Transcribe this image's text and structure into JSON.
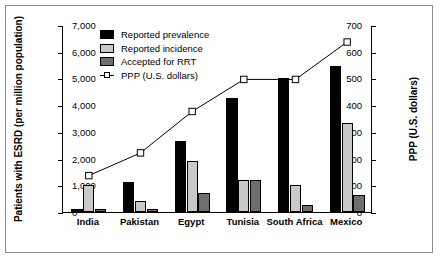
{
  "chart_data": {
    "type": "bar",
    "title": "",
    "subtitle": "",
    "categories": [
      "India",
      "Pakistan",
      "Egypt",
      "Tunisia",
      "South Africa",
      "Mexico"
    ],
    "xlabel": "",
    "ylabel": "Patients with ESRD (per million population)",
    "ylim": [
      0,
      700
    ],
    "yticks": [
      "0",
      "100",
      "200",
      "300",
      "400",
      "500",
      "600",
      "700"
    ],
    "ytick_values": [
      0,
      100,
      200,
      300,
      400,
      500,
      600,
      700
    ],
    "y2label": "PPP (U.S. dollars)",
    "y2lim": [
      0,
      7000
    ],
    "y2ticks": [
      "0",
      "1,000",
      "2,000",
      "3,000",
      "4,000",
      "5,000",
      "6,000",
      "7,000"
    ],
    "y2tick_values": [
      0,
      1000,
      2000,
      3000,
      4000,
      5000,
      6000,
      7000
    ],
    "grid": false,
    "legend_position": "upper-left-inside",
    "series": [
      {
        "name": "Reported prevalence",
        "kind": "bar",
        "axis": "left",
        "color": "#000000",
        "values": [
          10,
          112,
          264,
          425,
          500,
          545
        ]
      },
      {
        "name": "Reported incidence",
        "kind": "bar",
        "axis": "left",
        "color": "#c9c9c9",
        "values": [
          102,
          40,
          192,
          118,
          100,
          335
        ]
      },
      {
        "name": "Accepted for RRT",
        "kind": "bar",
        "axis": "left",
        "color": "#6e6e6e",
        "values": [
          10,
          10,
          70,
          118,
          25,
          62
        ]
      },
      {
        "name": "PPP (U.S. dollars)",
        "kind": "line",
        "axis": "right",
        "color": "#000000",
        "marker": "open-square",
        "values": [
          1400,
          2250,
          3800,
          5000,
          5000,
          6400
        ]
      }
    ]
  },
  "legend": {
    "items": [
      {
        "label": "Reported prevalence",
        "swatch": "black-square-swatch"
      },
      {
        "label": "Reported incidence",
        "swatch": "light-gray-square-swatch"
      },
      {
        "label": "Accepted for RRT",
        "swatch": "dark-gray-square-swatch"
      },
      {
        "label": "PPP (U.S. dollars)",
        "swatch": "open-square-line-marker"
      }
    ]
  },
  "colors": {
    "prevalence": "#000000",
    "incidence": "#c9c9c9",
    "rrt": "#6e6e6e",
    "line": "#000000",
    "frame": "#8c8c8c",
    "axis": "#000000",
    "background": "#ffffff"
  }
}
